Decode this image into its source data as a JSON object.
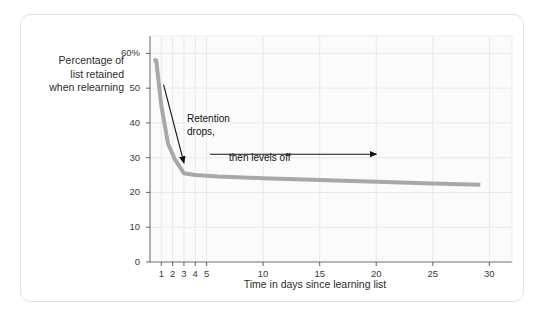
{
  "figure": {
    "background_color": "#ffffff",
    "card_border_color": "#e2e2e2"
  },
  "chart_data": {
    "type": "line",
    "title": "",
    "subtitle": "",
    "xlabel": "Time in days since learning list",
    "ylabel": "Percentage of list retained when relearning",
    "ylabel_lines": [
      "Percentage of",
      "list retained",
      "when relearning"
    ],
    "xlim": [
      0,
      32
    ],
    "ylim": [
      0,
      65
    ],
    "grid": true,
    "legend": "none",
    "series": [
      {
        "name": "Retention curve",
        "color": "#a8a8a8",
        "line_width": 4,
        "x": [
          0.3,
          0.55,
          1.0,
          1.6,
          2.2,
          3.0,
          4.0,
          6.0,
          10.0,
          15.0,
          20.0,
          25.0,
          29.2
        ],
        "y": [
          58,
          58,
          45,
          34,
          29.5,
          25.5,
          25.0,
          24.6,
          24.1,
          23.6,
          23.1,
          22.6,
          22.2
        ]
      }
    ],
    "x_ticks": [
      {
        "value": 1,
        "label": "1"
      },
      {
        "value": 2,
        "label": "2"
      },
      {
        "value": 3,
        "label": "3"
      },
      {
        "value": 4,
        "label": "4"
      },
      {
        "value": 5,
        "label": "5"
      },
      {
        "value": 10,
        "label": "10"
      },
      {
        "value": 15,
        "label": "15"
      },
      {
        "value": 20,
        "label": "20"
      },
      {
        "value": 25,
        "label": "25"
      },
      {
        "value": 30,
        "label": "30"
      }
    ],
    "y_ticks": [
      {
        "value": 0,
        "label": "0"
      },
      {
        "value": 10,
        "label": "10"
      },
      {
        "value": 20,
        "label": "20"
      },
      {
        "value": 30,
        "label": "30"
      },
      {
        "value": 40,
        "label": "40"
      },
      {
        "value": 50,
        "label": "50"
      },
      {
        "value": 60,
        "label": "60%"
      }
    ],
    "annotations": [
      {
        "id": "retention-drops",
        "text_lines": [
          "Retention",
          "drops,"
        ],
        "text": "Retention drops,",
        "arrow": {
          "from": [
            1.2,
            51
          ],
          "to": [
            3.0,
            28.5
          ],
          "style": "diagonal-down"
        }
      },
      {
        "id": "then-levels-off",
        "text_lines": [
          "then levels off"
        ],
        "text": "then levels off",
        "arrow": {
          "from": [
            5.3,
            31
          ],
          "to": [
            20.0,
            31
          ],
          "style": "horizontal-right"
        }
      }
    ],
    "plot_area": {
      "left_px": 150,
      "top_px": 36,
      "right_px": 512,
      "bottom_px": 262,
      "background_color": "#fbfbfb",
      "gridline_color": "#e8e8e8",
      "axis_color": "#6f6f6f"
    }
  }
}
